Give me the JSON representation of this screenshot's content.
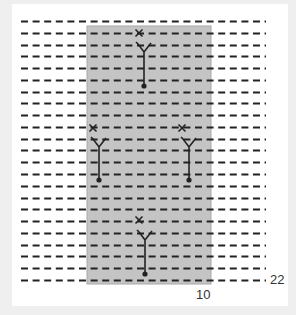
{
  "diagram": {
    "type": "knitting-chart",
    "colors": {
      "background": "#efefef",
      "panel": "#ffffff",
      "highlight_fill": "#c4c4c4",
      "highlight_border": "#a8a8a8",
      "ink": "#222222"
    },
    "grid": {
      "rows": 23,
      "first_row_y": 21,
      "row_spacing": 11.77,
      "dash_start_x": 21,
      "dash_end_x": 266,
      "dash_length": 7,
      "dash_gap": 4.6
    },
    "highlight_region": {
      "x": 87,
      "y": 26,
      "width": 124,
      "height": 258
    },
    "symbols": [
      {
        "name": "symbol-top",
        "x_mark": [
          139,
          33
        ],
        "fork": [
          144,
          52
        ],
        "dot": [
          144,
          86
        ]
      },
      {
        "name": "symbol-left",
        "x_mark": [
          93,
          128
        ],
        "fork": [
          99,
          147
        ],
        "dot": [
          99,
          180
        ]
      },
      {
        "name": "symbol-right",
        "x_mark": [
          182,
          128
        ],
        "fork": [
          189,
          147
        ],
        "dot": [
          189,
          180
        ]
      },
      {
        "name": "symbol-bottom",
        "x_mark": [
          139,
          220
        ],
        "fork": [
          145,
          240
        ],
        "dot": [
          145,
          274
        ]
      }
    ],
    "labels": {
      "column_label": "10",
      "row_label": "22"
    }
  }
}
